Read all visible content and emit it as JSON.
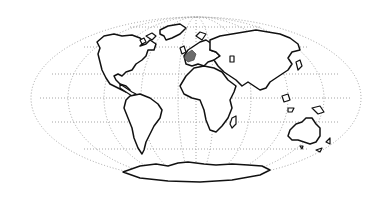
{
  "map": {
    "projection": "mollweide-like elliptical world outline",
    "style": "line drawing",
    "colors": {
      "background": "#ffffff",
      "coastline": "#111111",
      "graticule": "#9a9a9a",
      "highlight": "#6b6b6b"
    },
    "continents": [
      "North America",
      "South America",
      "Europe",
      "Africa",
      "Asia",
      "Australia",
      "Antarctica"
    ],
    "highlighted_region": "Western Europe (France / Spain area)",
    "graticule": {
      "meridians": 9,
      "parallels": 5,
      "line_style": "dotted"
    }
  }
}
